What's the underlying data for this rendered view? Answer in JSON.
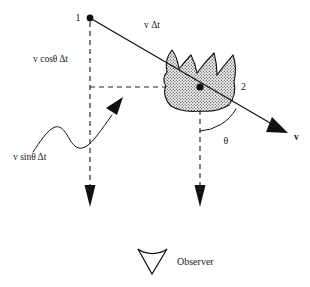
{
  "figure": {
    "type": "physics-diagram",
    "background_color": "#ffffff",
    "ink_color": "#111111",
    "width": 310,
    "height": 287
  },
  "labels": {
    "point_one": "1",
    "point_two": "2",
    "hypotenuse": "v Δt",
    "vertical_leg": "v cosθ Δt",
    "horizontal_leg": "v sinθ Δt",
    "angle": "θ",
    "velocity": "v",
    "observer": "Observer"
  },
  "geometry": {
    "point_one": {
      "x": 90,
      "y": 18
    },
    "point_two": {
      "x": 200,
      "y": 87
    },
    "velocity_arrow_tip": {
      "x": 287,
      "y": 133
    },
    "vertical_dashed_left": {
      "x": 90,
      "y_top": 22,
      "y_bottom": 205
    },
    "vertical_dashed_right": {
      "x": 200,
      "y_top": 92,
      "y_bottom": 205
    },
    "horizontal_dashed": {
      "y": 87,
      "x_start": 90,
      "x_end": 200
    },
    "angle_arc_radius": 44,
    "blob_center": {
      "x": 200,
      "y": 80
    },
    "observer_icon": {
      "x": 152,
      "y": 258
    }
  },
  "elements": {
    "blob_fill": "stippled-gray",
    "blob_description": "irregular stippled nebula-like shape with two horn protrusions",
    "wavy_arrow_description": "undulating curve ending in an up-right arrowhead",
    "observer_icon_description": "funnel / V shape with concave top edge"
  }
}
